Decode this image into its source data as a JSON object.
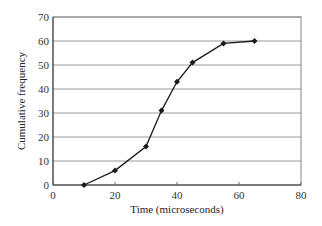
{
  "chart_data": {
    "type": "line",
    "title": "",
    "xlabel": "Time (microseconds)",
    "ylabel": "Cumulative frequency",
    "x": [
      10,
      20,
      30,
      35,
      40,
      45,
      55,
      65
    ],
    "series": [
      {
        "name": "Cumulative frequency",
        "values": [
          0,
          6,
          16,
          31,
          43,
          51,
          59,
          60
        ],
        "marker": "diamond",
        "color": "#1a1a1a"
      }
    ],
    "xlim": [
      0,
      80
    ],
    "ylim": [
      0,
      70
    ],
    "xticks": [
      0,
      20,
      40,
      60,
      80
    ],
    "yticks": [
      0,
      10,
      20,
      30,
      40,
      50,
      60,
      70
    ],
    "grid": "horizontal",
    "legend": "none"
  }
}
